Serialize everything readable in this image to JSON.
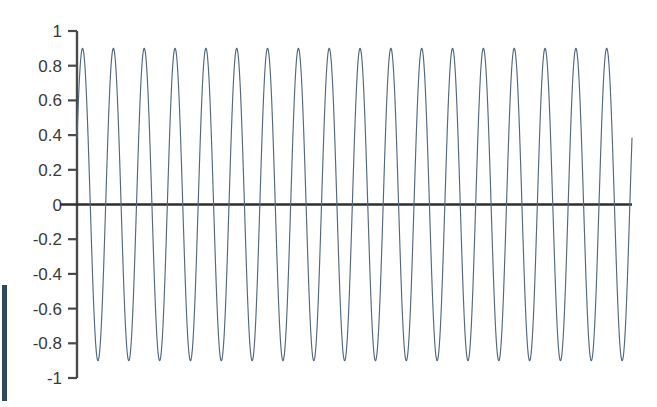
{
  "chart_data": {
    "type": "line",
    "title": "",
    "subtitle": "",
    "xlabel": "",
    "ylabel": "",
    "grid": false,
    "legend": false,
    "legend_position": "none",
    "series_color": "#53677d",
    "zero_line_color": "#2e2e2e",
    "axis_color": "#4a4a4a",
    "label_color": "#3a3a3a",
    "waveform": "sinusoid",
    "amplitude": 0.9,
    "cycles": 18,
    "ylim": [
      -1,
      1
    ],
    "xlim": [
      0,
      18
    ],
    "ytick_labels": [
      "1",
      "0.8",
      "0.6",
      "0.4",
      "0.2",
      "0",
      "-0.2",
      "-0.4",
      "-0.6",
      "-0.8",
      "-1"
    ],
    "ytick_values": [
      1,
      0.8,
      0.6,
      0.4,
      0.2,
      0,
      -0.2,
      -0.4,
      -0.6,
      -0.8,
      -1
    ],
    "xtick_labels": [],
    "xtick_values": [],
    "phase_offset_fraction": 0.07,
    "series": [
      {
        "name": "signal",
        "description": "0.9 amplitude sine wave, 18 full cycles across the plot width"
      }
    ]
  },
  "accent": {
    "edge_bar_color": "#2b4a60"
  }
}
